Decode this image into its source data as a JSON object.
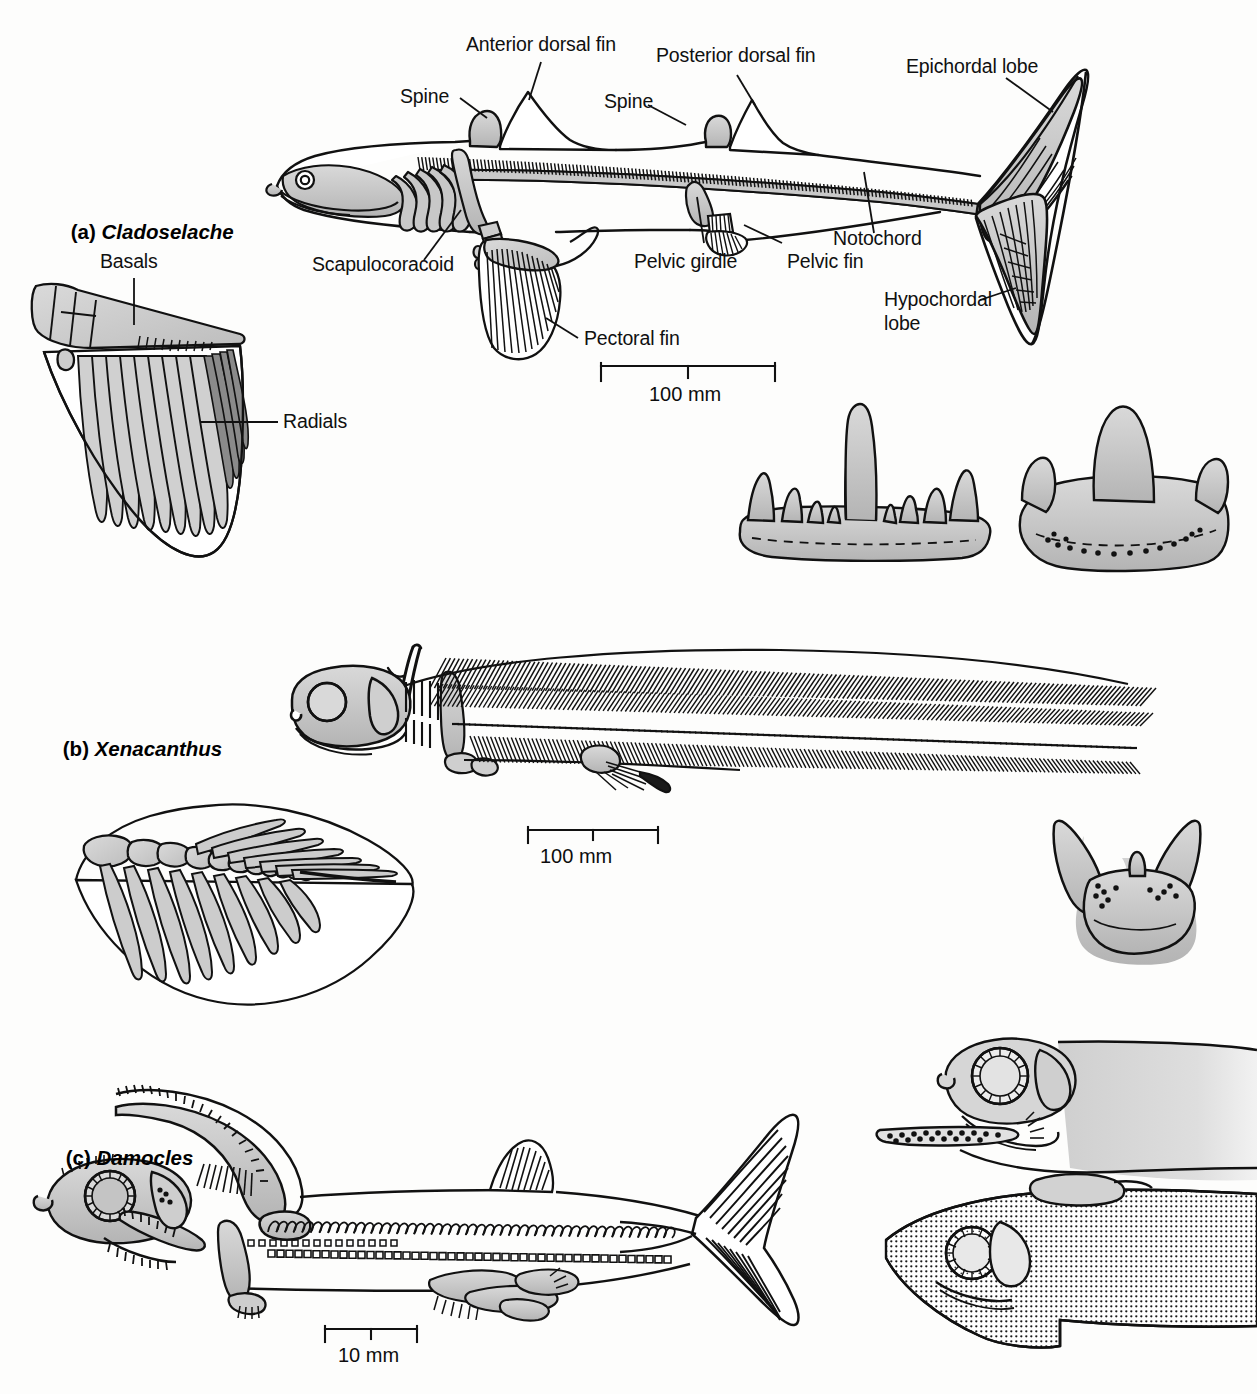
{
  "figure": {
    "background_color": "#fdfdfc",
    "ink_color": "#0d0d0d",
    "bone_fill_color": "#c6c6c6",
    "bone_fill_light": "#d8d8d8"
  },
  "panels": [
    {
      "id": "a",
      "marker": "(a)",
      "genus": "Cladoselache",
      "scale_bar": {
        "value": "100 mm"
      },
      "labels": [
        {
          "name": "anterior-dorsal-fin",
          "text": "Anterior dorsal fin"
        },
        {
          "name": "spine-anterior",
          "text": "Spine"
        },
        {
          "name": "posterior-dorsal-fin",
          "text": "Posterior dorsal fin"
        },
        {
          "name": "spine-posterior",
          "text": "Spine"
        },
        {
          "name": "epichordal-lobe",
          "text": "Epichordal lobe"
        },
        {
          "name": "notochord",
          "text": "Notochord"
        },
        {
          "name": "pelvic-girdle",
          "text": "Pelvic girdle"
        },
        {
          "name": "pelvic-fin",
          "text": "Pelvic fin"
        },
        {
          "name": "hypochordal-lobe",
          "text": "Hypochordal\nlobe"
        },
        {
          "name": "scapulocoracoid",
          "text": "Scapulocoracoid"
        },
        {
          "name": "pectoral-fin",
          "text": "Pectoral fin"
        },
        {
          "name": "basals",
          "text": "Basals"
        },
        {
          "name": "radials",
          "text": "Radials"
        }
      ],
      "insets": [
        {
          "name": "pectoral-fin-detail",
          "caption": ""
        },
        {
          "name": "cladodont-tooth-lateral",
          "caption": ""
        },
        {
          "name": "cladodont-tooth-anterior",
          "caption": ""
        }
      ]
    },
    {
      "id": "b",
      "marker": "(b)",
      "genus": "Xenacanthus",
      "scale_bar": {
        "value": "100 mm"
      },
      "labels": [],
      "insets": [
        {
          "name": "pectoral-fin-detail",
          "caption": ""
        },
        {
          "name": "xenacanth-tooth",
          "caption": ""
        }
      ]
    },
    {
      "id": "c",
      "marker": "(c)",
      "genus": "Damocles",
      "scale_bar": {
        "value": "10 mm"
      },
      "labels": [],
      "insets": [
        {
          "name": "head-detail-male",
          "caption": ""
        },
        {
          "name": "head-detail-female",
          "caption": ""
        }
      ]
    }
  ],
  "labels_text": {
    "anterior_dorsal_fin": "Anterior dorsal fin",
    "spine_1": "Spine",
    "spine_2": "Spine",
    "posterior_dorsal_fin": "Posterior dorsal fin",
    "epichordal_lobe": "Epichordal lobe",
    "notochord": "Notochord",
    "pelvic_girdle": "Pelvic girdle",
    "pelvic_fin": "Pelvic fin",
    "hypochordal_lobe_1": "Hypochordal",
    "hypochordal_lobe_2": "lobe",
    "scapulocoracoid": "Scapulocoracoid",
    "pectoral_fin": "Pectoral fin",
    "basals": "Basals",
    "radials": "Radials"
  },
  "panel_titles": {
    "a_marker": "(a) ",
    "a_genus": "Cladoselache",
    "b_marker": "(b) ",
    "b_genus": "Xenacanthus",
    "c_marker": "(c) ",
    "c_genus": "Damocles"
  },
  "scale_bars": {
    "a": "100 mm",
    "b": "100 mm",
    "c": "10 mm"
  }
}
